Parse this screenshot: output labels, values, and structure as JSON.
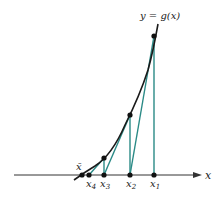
{
  "diagram": {
    "curve_label": "y = g(x)",
    "axis_label": "x",
    "points": [
      {
        "label": "x̄",
        "name": "x-bar"
      },
      {
        "label": "x",
        "sub": "4"
      },
      {
        "label": "x",
        "sub": "3"
      },
      {
        "label": "x",
        "sub": "2"
      },
      {
        "label": "x",
        "sub": "1"
      }
    ],
    "colors": {
      "curve": "#1a1a1a",
      "iteration": "#2a8a86",
      "axis": "#333333",
      "dot": "#111111"
    }
  }
}
